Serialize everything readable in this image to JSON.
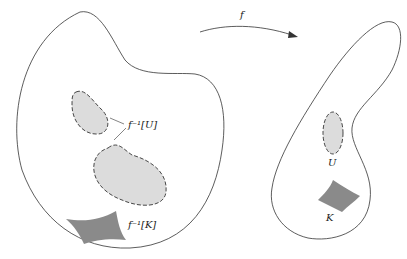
{
  "diagram": {
    "map_label": "f",
    "preimage_U_label": "f⁻¹[U]",
    "preimage_K_label": "f⁻¹[K]",
    "U_label": "U",
    "K_label": "K",
    "colors": {
      "outline": "#333333",
      "open_fill": "#dcdcdc",
      "compact_fill": "#8a8a8a",
      "background": "#ffffff"
    }
  }
}
